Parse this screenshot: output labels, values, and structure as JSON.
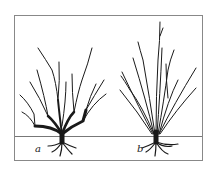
{
  "figure": {
    "type": "botanical line drawing",
    "panels": [
      {
        "id": "a",
        "label": "a",
        "description": "shrub with thick spreading lower branches and many upward laterals"
      },
      {
        "id": "b",
        "label": "b",
        "description": "shrub with many slender upright stems from a compact base"
      }
    ],
    "colors": {
      "ink": "#1a1a1a",
      "frame": "#888888",
      "background": "#ffffff"
    }
  }
}
